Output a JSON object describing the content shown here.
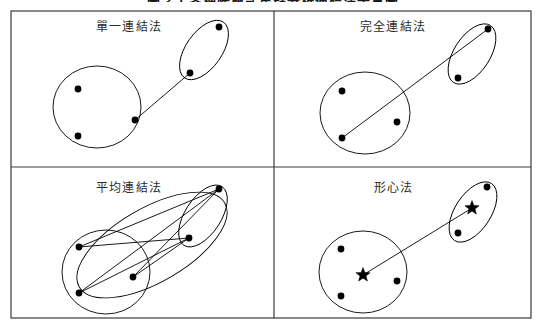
{
  "figure": {
    "title": "圖 3-1 各種階層式集群分析連結法示意圖",
    "title_visible_fragment": "圖 3-1 各種階層式集群分析連結法示意圖",
    "frame_color": "#3a3a3a",
    "ink_color": "#000000",
    "background_color": "#ffffff"
  },
  "panels": [
    {
      "id": "single-linkage",
      "label": "單一連結法",
      "link_style": "nearest-pair",
      "description": "一條線連接兩群中最接近的兩個點",
      "cluster_a": {
        "shape": "circle",
        "cx": 97,
        "cy": 107,
        "rx": 44,
        "ry": 41,
        "rotate": 0,
        "points": [
          [
            78,
            89
          ],
          [
            78,
            136
          ],
          [
            135,
            120
          ]
        ]
      },
      "cluster_b": {
        "shape": "ellipse",
        "cx": 204,
        "cy": 50,
        "rx": 18,
        "ry": 34,
        "rotate": 35,
        "points": [
          [
            219,
            27
          ],
          [
            190,
            73
          ]
        ]
      },
      "links": [
        [
          [
            135,
            120
          ],
          [
            190,
            73
          ]
        ]
      ],
      "markers": []
    },
    {
      "id": "complete-linkage",
      "label": "完全連結法",
      "link_style": "farthest-pair",
      "description": "一條線連接兩群中距離最遠的兩個點",
      "cluster_a": {
        "shape": "circle",
        "cx": 365,
        "cy": 113,
        "rx": 45,
        "ry": 41,
        "rotate": 0,
        "points": [
          [
            342,
            91
          ],
          [
            342,
            138
          ],
          [
            397,
            122
          ]
        ]
      },
      "cluster_b": {
        "shape": "ellipse",
        "cx": 472,
        "cy": 54,
        "rx": 18,
        "ry": 34,
        "rotate": 33,
        "points": [
          [
            488,
            29
          ],
          [
            458,
            78
          ]
        ]
      },
      "links": [
        [
          [
            342,
            138
          ],
          [
            488,
            29
          ]
        ]
      ],
      "markers": []
    },
    {
      "id": "average-linkage",
      "label": "平均連結法",
      "link_style": "all-pairs",
      "description": "所有點對之間皆連線，取平均距離",
      "cluster_a": {
        "shape": "circle",
        "cx": 106,
        "cy": 272,
        "rx": 44,
        "ry": 42,
        "rotate": 0,
        "points": [
          [
            79,
            247
          ],
          [
            79,
            293
          ],
          [
            133,
            277
          ]
        ]
      },
      "cluster_b": {
        "shape": "ellipse",
        "cx": 203,
        "cy": 216,
        "rx": 18,
        "ry": 35,
        "rotate": 33,
        "points": [
          [
            219,
            189
          ],
          [
            189,
            238
          ]
        ]
      },
      "outer": {
        "shape": "ellipse",
        "cx": 152,
        "cy": 245,
        "rx": 84,
        "ry": 37,
        "rotate": -30
      },
      "links": [
        [
          [
            79,
            247
          ],
          [
            219,
            189
          ]
        ],
        [
          [
            79,
            247
          ],
          [
            189,
            238
          ]
        ],
        [
          [
            79,
            293
          ],
          [
            219,
            189
          ]
        ],
        [
          [
            79,
            293
          ],
          [
            189,
            238
          ]
        ],
        [
          [
            133,
            277
          ],
          [
            219,
            189
          ]
        ],
        [
          [
            133,
            277
          ],
          [
            189,
            238
          ]
        ]
      ],
      "markers": []
    },
    {
      "id": "centroid-method",
      "label": "形心法",
      "link_style": "centroid-to-centroid",
      "description": "一條線連接兩群的形心（星形標記）",
      "cluster_a": {
        "shape": "circle",
        "cx": 363,
        "cy": 272,
        "rx": 44,
        "ry": 41,
        "rotate": 0,
        "points": [
          [
            341,
            249
          ],
          [
            341,
            296
          ],
          [
            397,
            281
          ]
        ]
      },
      "cluster_b": {
        "shape": "ellipse",
        "cx": 473,
        "cy": 212,
        "rx": 18,
        "ry": 34,
        "rotate": 33,
        "points": [
          [
            487,
            187
          ],
          [
            458,
            233
          ]
        ]
      },
      "links": [
        [
          [
            363,
            275
          ],
          [
            472,
            208
          ]
        ]
      ],
      "markers": [
        {
          "type": "star",
          "x": 363,
          "y": 275,
          "size": 7.5
        },
        {
          "type": "star",
          "x": 472,
          "y": 208,
          "size": 7.5
        }
      ]
    }
  ],
  "frame": {
    "outer": {
      "x": 11,
      "y": 11,
      "width": 520,
      "height": 307
    },
    "divider_vertical_x": 274,
    "divider_horizontal_y": 167
  },
  "geometry": {
    "point_radius": 3.4,
    "stroke_width": 0.9,
    "frame_stroke_width": 1.2
  }
}
